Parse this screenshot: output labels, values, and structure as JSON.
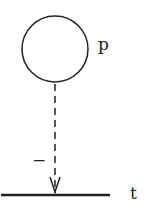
{
  "diagram": {
    "nodes": [
      {
        "id": "p",
        "label": "p",
        "shape": "circle"
      },
      {
        "id": "t",
        "label": "t",
        "shape": "line"
      }
    ],
    "edges": [
      {
        "from": "p",
        "to": "t",
        "style": "dashed",
        "arrow": "open-v",
        "label": "−"
      }
    ]
  },
  "labels": {
    "node_p": "p",
    "node_t": "t",
    "edge_sign": "−"
  },
  "colors": {
    "stroke": "#222222",
    "background": "#ffffff"
  }
}
